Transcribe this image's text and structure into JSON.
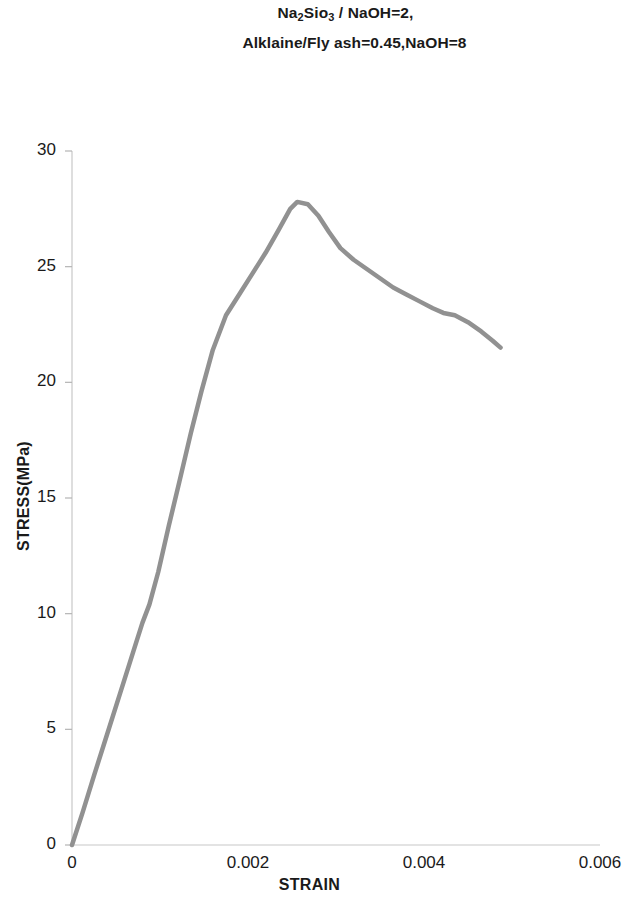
{
  "title": {
    "line1_pre": "Na",
    "line1_sub1": "2",
    "line1_mid": "Sio",
    "line1_sub2": "3",
    "line1_post": " / NaOH=2,",
    "line2": "Alklaine/Fly ash=0.45,NaOH=8"
  },
  "axes": {
    "x_title": "STRAIN",
    "y_title": "STRESS(MPa)"
  },
  "chart_data": {
    "type": "line",
    "title": "Na2Sio3 / NaOH=2, Alklaine/Fly ash=0.45,NaOH=8",
    "xlabel": "STRAIN",
    "ylabel": "STRESS(MPa)",
    "xlim": [
      0,
      0.006
    ],
    "ylim": [
      0,
      30
    ],
    "xticks": [
      0,
      0.002,
      0.004,
      0.006
    ],
    "xtick_labels": [
      "0",
      "0.002",
      "0.004",
      "0.006"
    ],
    "yticks": [
      0,
      5,
      10,
      15,
      20,
      25,
      30
    ],
    "ytick_labels": [
      "0",
      "5",
      "10",
      "15",
      "20",
      "25",
      "30"
    ],
    "grid": false,
    "legend": "none",
    "line_color": "#919191",
    "line_width": 4.5,
    "series": [
      {
        "name": "stress-strain",
        "x": [
          0.0,
          0.00012,
          0.00025,
          0.0004,
          0.00055,
          0.0007,
          0.0008,
          0.00088,
          0.00098,
          0.0011,
          0.00122,
          0.00135,
          0.00147,
          0.0016,
          0.00175,
          0.0019,
          0.00205,
          0.0022,
          0.00235,
          0.00248,
          0.00256,
          0.00268,
          0.0028,
          0.00292,
          0.00305,
          0.0032,
          0.00335,
          0.0035,
          0.00365,
          0.0038,
          0.00395,
          0.0041,
          0.00422,
          0.00435,
          0.0045,
          0.00465,
          0.00478,
          0.00487
        ],
        "y": [
          0.0,
          1.4,
          3.0,
          4.8,
          6.6,
          8.4,
          9.6,
          10.4,
          11.8,
          13.8,
          15.7,
          17.8,
          19.6,
          21.4,
          22.9,
          23.8,
          24.7,
          25.6,
          26.6,
          27.5,
          27.8,
          27.7,
          27.2,
          26.5,
          25.8,
          25.3,
          24.9,
          24.5,
          24.1,
          23.8,
          23.5,
          23.2,
          23.0,
          22.9,
          22.6,
          22.2,
          21.8,
          21.5
        ]
      }
    ],
    "peak": {
      "strain": 0.00256,
      "stress": 27.8
    }
  }
}
